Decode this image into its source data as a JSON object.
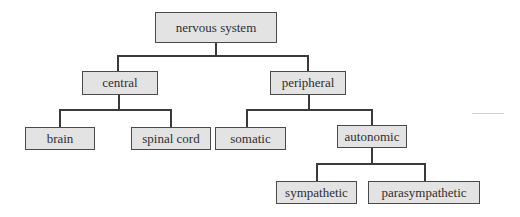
{
  "diagram": {
    "type": "tree",
    "root": {
      "label": "nervous system",
      "children": [
        {
          "label": "central",
          "children": [
            {
              "label": "brain"
            },
            {
              "label": "spinal cord"
            }
          ]
        },
        {
          "label": "peripheral",
          "children": [
            {
              "label": "somatic"
            },
            {
              "label": "autonomic",
              "children": [
                {
                  "label": "sympathetic"
                },
                {
                  "label": "parasympathetic"
                }
              ]
            }
          ]
        }
      ]
    },
    "colors": {
      "box_fill": "#e3e3e3",
      "box_border": "#4a4a4a",
      "line": "#3a3a3a",
      "text": "#2f2f2f"
    }
  }
}
